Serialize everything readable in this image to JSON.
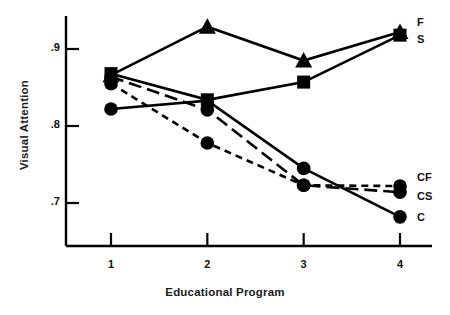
{
  "chart_data": {
    "type": "line",
    "title": "",
    "xlabel": "Educational Program",
    "ylabel": "Visual Attention",
    "categories": [
      "1",
      "2",
      "3",
      "4"
    ],
    "x": [
      1,
      2,
      3,
      4
    ],
    "xlim": [
      0.6,
      4.4
    ],
    "ylim": [
      0.655,
      0.945
    ],
    "yticks": [
      ".9",
      ".8",
      ".7"
    ],
    "ytick_values": [
      0.9,
      0.8,
      0.7
    ],
    "xticks": [
      "1",
      "2",
      "3",
      "4"
    ],
    "grid": false,
    "legend_position": "right-of-plot-end-labels",
    "series": [
      {
        "name": "F",
        "label": "F",
        "marker": "triangle",
        "linestyle": "solid",
        "color": "#000000",
        "values": [
          0.866,
          0.929,
          0.885,
          0.922
        ]
      },
      {
        "name": "S",
        "label": "S",
        "marker": "square",
        "linestyle": "solid",
        "color": "#000000",
        "values": [
          0.868,
          0.834,
          0.857,
          0.918
        ]
      },
      {
        "name": "CF",
        "label": "CF",
        "marker": "circle",
        "linestyle": "short-dashed",
        "color": "#000000",
        "values": [
          0.855,
          0.778,
          0.723,
          0.722
        ]
      },
      {
        "name": "CS",
        "label": "CS",
        "marker": "circle",
        "linestyle": "long-dashed",
        "color": "#000000",
        "values": [
          0.864,
          0.821,
          0.723,
          0.714
        ]
      },
      {
        "name": "C",
        "label": "C",
        "marker": "circle",
        "linestyle": "solid",
        "color": "#000000",
        "values": [
          0.822,
          0.833,
          0.745,
          0.682
        ]
      }
    ]
  },
  "axis": {
    "ytick_0": ".9",
    "ytick_1": ".8",
    "ytick_2": ".7",
    "xtick_0": "1",
    "xtick_1": "2",
    "xtick_2": "3",
    "xtick_3": "4",
    "ylabel": "Visual Attention",
    "xlabel": "Educational Program"
  },
  "series_labels": {
    "f": "F",
    "s": "S",
    "cf": "CF",
    "cs": "CS",
    "c": "C"
  },
  "style": {
    "ink": "#000000",
    "background": "#ffffff"
  }
}
